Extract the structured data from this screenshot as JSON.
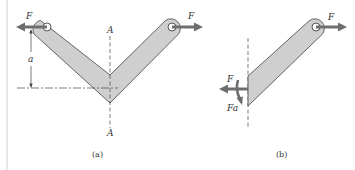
{
  "figure": {
    "panel_a": {
      "caption": "(a)",
      "force_left_label": "F",
      "force_right_label": "F",
      "dimension_label": "a",
      "section_label_top": "A",
      "section_label_bottom": "A"
    },
    "panel_b": {
      "caption": "(b)",
      "force_right_label": "F",
      "internal_force_label": "F",
      "internal_moment_label": "Fa"
    }
  },
  "colors": {
    "bar_fill": "#cfcfcf",
    "bar_stroke": "#555555",
    "arrow": "#6e6e6e",
    "line": "#444444",
    "border": "#d0d0d0"
  }
}
